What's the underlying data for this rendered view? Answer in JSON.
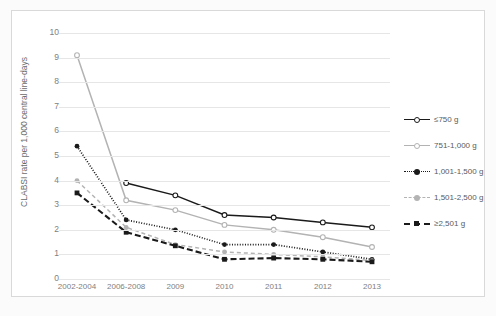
{
  "chart_data": {
    "type": "line",
    "title": "",
    "xlabel": "",
    "ylabel": "CLABSI rate per 1,000 central line-days",
    "categories": [
      "2002-2004",
      "2006-2008",
      "2009",
      "2010",
      "2011",
      "2012",
      "2013"
    ],
    "ylim": [
      0,
      10
    ],
    "ytick_labels": [
      "0",
      "1",
      "2",
      "3",
      "4",
      "5",
      "6",
      "7",
      "8",
      "9",
      "10"
    ],
    "yticks": [
      0,
      1,
      2,
      3,
      4,
      5,
      6,
      7,
      8,
      9,
      10
    ],
    "grid": true,
    "legend_position": "right",
    "series": [
      {
        "name": "≤750 g",
        "color": "#1a1a1a",
        "style": "solid",
        "marker": "open-circle",
        "values": [
          null,
          3.9,
          3.4,
          2.6,
          2.5,
          2.3,
          2.1
        ]
      },
      {
        "name": "751-1,000 g",
        "color": "#b3b3b3",
        "style": "solid",
        "marker": "open-circle",
        "values": [
          9.1,
          3.2,
          2.8,
          2.2,
          2.0,
          1.7,
          1.3
        ]
      },
      {
        "name": "1,001-1,500 g",
        "color": "#1a1a1a",
        "style": "dotted",
        "marker": "filled-circle",
        "values": [
          5.4,
          2.4,
          2.0,
          1.4,
          1.4,
          1.1,
          0.8
        ]
      },
      {
        "name": "1,501-2,500 g",
        "color": "#b3b3b3",
        "style": "dashed",
        "marker": "filled-circle",
        "values": [
          4.0,
          2.1,
          1.4,
          1.1,
          1.0,
          0.9,
          0.75
        ]
      },
      {
        "name": "≥2,501 g",
        "color": "#1a1a1a",
        "style": "heavy-dashed",
        "marker": "filled-square",
        "values": [
          3.5,
          1.9,
          1.35,
          0.8,
          0.85,
          0.8,
          0.7
        ]
      }
    ]
  },
  "axis": {
    "y_title": "CLABSI rate per 1,000 central line-days"
  }
}
